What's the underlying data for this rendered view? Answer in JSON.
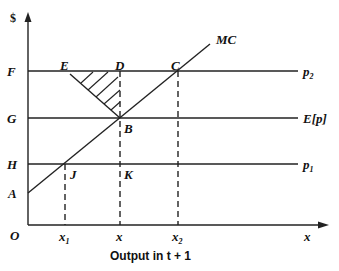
{
  "diagram": {
    "y_axis_label": "$",
    "x_axis_label": "x",
    "caption": "Output in t + 1",
    "origin_label": "O",
    "price_levels": [
      {
        "key": "F",
        "line_label": "p",
        "line_sub": "2",
        "y": 71
      },
      {
        "key": "G",
        "line_label": "E[p]",
        "line_sub": "",
        "y": 118
      },
      {
        "key": "H",
        "line_label": "p",
        "line_sub": "1",
        "y": 164
      }
    ],
    "intercept_label": "A",
    "curve_label": "MC",
    "points": {
      "E": "E",
      "D": "D",
      "C": "C",
      "B": "B",
      "J": "J",
      "K": "K"
    },
    "x_ticks": [
      {
        "label": "x",
        "sub": "1"
      },
      {
        "label": "x",
        "sub": ""
      },
      {
        "label": "x",
        "sub": "2"
      }
    ],
    "shaded_region": "Triangle EDB (hatched)"
  }
}
